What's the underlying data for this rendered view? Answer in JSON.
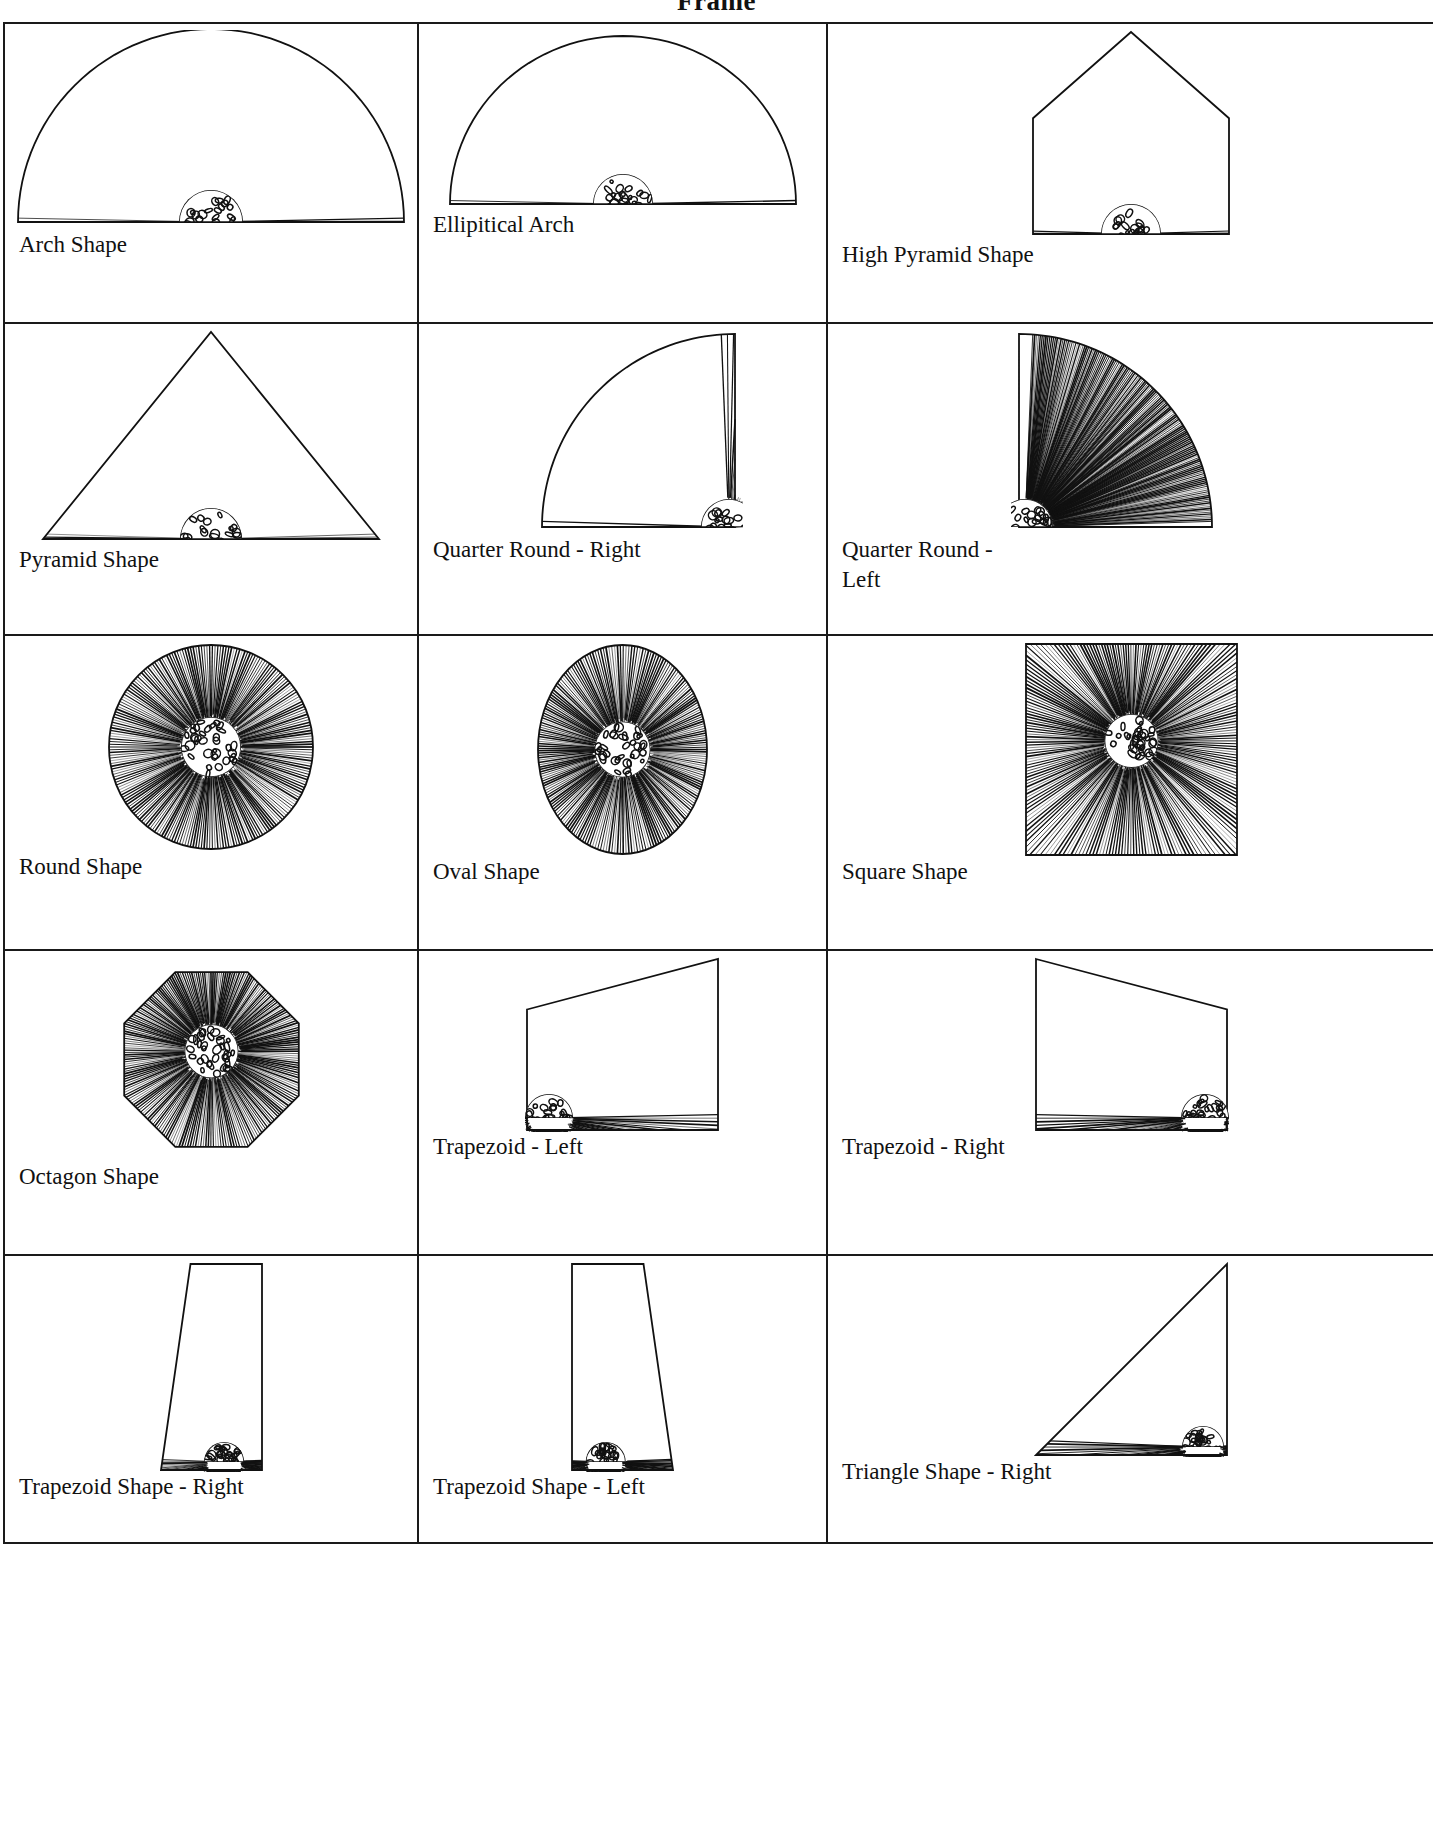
{
  "document": {
    "title": "Frame"
  },
  "table": {
    "columns": 3,
    "rows": [
      [
        {
          "label": "Arch Shape",
          "shape": "arch",
          "art_w": 390,
          "art_h": 200
        },
        {
          "label": "Ellipitical Arch",
          "shape": "elliptical-arch",
          "art_w": 350,
          "art_h": 180
        },
        {
          "label": "High Pyramid Shape",
          "shape": "high-pyramid",
          "art_w": 200,
          "art_h": 210
        }
      ],
      [
        {
          "label": "Pyramid Shape",
          "shape": "pyramid",
          "art_w": 340,
          "art_h": 215
        },
        {
          "label": "Quarter Round - Right",
          "shape": "quarter-right",
          "art_w": 240,
          "art_h": 205
        },
        {
          "label": "Quarter Round -\nLeft",
          "shape": "quarter-left",
          "art_w": 240,
          "art_h": 205
        }
      ],
      [
        {
          "label": "Round Shape",
          "shape": "round",
          "art_w": 210,
          "art_h": 210
        },
        {
          "label": "Oval Shape",
          "shape": "oval",
          "art_w": 175,
          "art_h": 215
        },
        {
          "label": "Square Shape",
          "shape": "square",
          "art_w": 215,
          "art_h": 215
        }
      ],
      [
        {
          "label": "Octagon Shape",
          "shape": "octagon",
          "art_w": 195,
          "art_h": 205
        },
        {
          "label": "Trapezoid  - Left",
          "shape": "trapezoid-left",
          "art_w": 195,
          "art_h": 175
        },
        {
          "label": "Trapezoid - Right",
          "shape": "trapezoid-right",
          "art_w": 195,
          "art_h": 175
        }
      ],
      [
        {
          "label": "Trapezoid Shape - Right",
          "shape": "tall-trap-right",
          "art_w": 105,
          "art_h": 210
        },
        {
          "label": "Trapezoid Shape - Left",
          "shape": "tall-trap-left",
          "art_w": 105,
          "art_h": 210
        },
        {
          "label": "Triangle Shape - Right",
          "shape": "triangle-right",
          "art_w": 195,
          "art_h": 195
        }
      ]
    ]
  },
  "style": {
    "ink": "#111111",
    "border": "#1a1a1a",
    "paper": "#ffffff"
  }
}
